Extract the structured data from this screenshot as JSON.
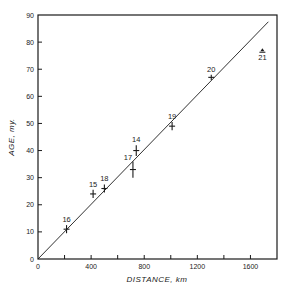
{
  "chart_data": {
    "type": "scatter",
    "title": "",
    "xlabel": "DISTANCE,  km",
    "ylabel": "AGE,  my.",
    "xlim": [
      0,
      1800
    ],
    "ylim": [
      0,
      90
    ],
    "grid": false,
    "legend": null,
    "x_ticks": [
      0,
      200,
      400,
      600,
      800,
      1000,
      1200,
      1400,
      1600
    ],
    "x_tick_labels": [
      "0",
      "",
      "400",
      "",
      "800",
      "",
      "1200",
      "",
      "1600"
    ],
    "y_ticks": [
      0,
      10,
      20,
      30,
      40,
      50,
      60,
      70,
      80,
      90
    ],
    "y_tick_labels": [
      "0",
      "10",
      "20",
      "30",
      "40",
      "50",
      "60",
      "70",
      "80",
      "90"
    ],
    "series": [
      {
        "name": "Samples",
        "marker": "cross-with-error-bars",
        "points": [
          {
            "label": "16",
            "x": 215,
            "y": 11,
            "xerr": 20,
            "yerr": 1.5
          },
          {
            "label": "15",
            "x": 415,
            "y": 24,
            "xerr": 20,
            "yerr": 1.5
          },
          {
            "label": "18",
            "x": 500,
            "y": 26,
            "xerr": 20,
            "yerr": 1.5
          },
          {
            "label": "17",
            "x": 715,
            "y": 33,
            "xerr": 20,
            "yerr": 3
          },
          {
            "label": "14",
            "x": 740,
            "y": 40,
            "xerr": 15,
            "yerr": 2
          },
          {
            "label": "19",
            "x": 1010,
            "y": 49,
            "xerr": 10,
            "yerr": 1.5
          },
          {
            "label": "20",
            "x": 1305,
            "y": 67,
            "xerr": 10,
            "yerr": 1
          },
          {
            "label": "21",
            "x": 1690,
            "y": 77,
            "xerr": 10,
            "yerr": 1,
            "marker": "lower-limit"
          }
        ]
      },
      {
        "name": "Best-fit line",
        "type": "line",
        "x": [
          0,
          1735
        ],
        "y": [
          0,
          87.5
        ]
      }
    ]
  }
}
